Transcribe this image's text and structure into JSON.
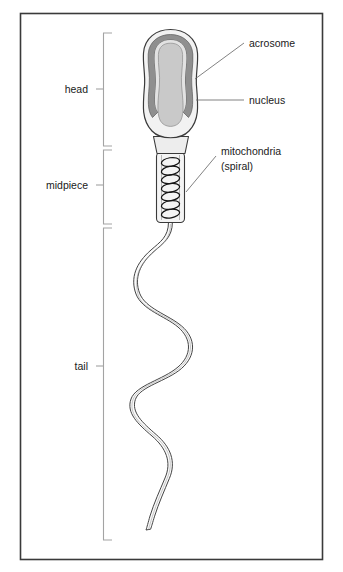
{
  "figure": {
    "title_alt": "Diagram of a human sperm cell showing head, midpiece and tail",
    "background_color": "#ffffff",
    "border_color": "#3a3a3a"
  },
  "region_labels": [
    {
      "id": "head",
      "text": "head",
      "x": 86,
      "y": 89,
      "bracket_top": 33,
      "bracket_bottom": 146,
      "tick_y": 89
    },
    {
      "id": "midpiece",
      "text": "midpiece",
      "x": 86,
      "y": 185,
      "bracket_top": 150,
      "bracket_bottom": 224,
      "tick_y": 185
    },
    {
      "id": "tail",
      "text": "tail",
      "x": 86,
      "y": 366,
      "bracket_top": 228,
      "bracket_bottom": 540,
      "tick_y": 366
    }
  ],
  "callout_labels": [
    {
      "id": "acrosome",
      "text": "acrosome",
      "x": 250,
      "y": 46,
      "line": "196,78 243,44"
    },
    {
      "id": "nucleus",
      "text": "nucleus",
      "x": 250,
      "y": 102,
      "line": "196,100 243,100"
    },
    {
      "id": "mitochondria",
      "text": "mitochondria",
      "x": 222,
      "y": 155,
      "line": "190,194 216,160"
    },
    {
      "id": "mitochondria_sub",
      "text": "(spiral)",
      "x": 222,
      "y": 170,
      "line": ""
    }
  ],
  "structure_colors": {
    "outline": "#333333",
    "membrane_fill": "#f2f2f2",
    "acrosome_fill": "#8f8f8f",
    "acrosome_inner_fill": "#e0e0e0",
    "nucleus_fill": "#c9c9c9",
    "collar_fill": "#ededed",
    "midpiece_fill": "#f4f4f4",
    "spiral_stroke": "#1a1a1a",
    "tail_fill": "#fafafa",
    "bracket_stroke": "#9a9a9a",
    "leader_stroke": "#6b6b6b"
  },
  "geometry": {
    "spiral_loop_count": 7,
    "midpiece_top": 152,
    "midpiece_bottom": 222,
    "head_top": 30,
    "head_bottom": 140,
    "tail_tip_y": 530
  }
}
